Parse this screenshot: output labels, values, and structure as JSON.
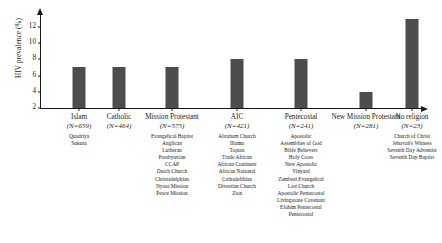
{
  "chart_data": {
    "type": "bar",
    "title": "",
    "xlabel": "",
    "ylabel": "HIV prevalence (%)",
    "ylim": [
      2,
      13.6
    ],
    "yticks": [
      2,
      4,
      6,
      8,
      10,
      12
    ],
    "grid": false,
    "legend": null,
    "categories": [
      "Islam",
      "Catholic",
      "Mission Protestant",
      "AIC",
      "Pentecostal",
      "New Mission Protestant",
      "No religion"
    ],
    "values": [
      7,
      7,
      7,
      8,
      8,
      4,
      13
    ],
    "sample_sizes": [
      "(N=659)",
      "(N=464)",
      "(N=575)",
      "(N=421)",
      "(N=241)",
      "(N=281)",
      "(N=23)"
    ],
    "bar_color": "#4d4d4d"
  },
  "groups": [
    {
      "label": "Islam",
      "n": "(N=659)",
      "value": 7,
      "denominations": [
        "Quadriya",
        "Sukutu"
      ]
    },
    {
      "label": "Catholic",
      "n": "(N=464)",
      "value": 7,
      "denominations": []
    },
    {
      "label": "Mission Protestant",
      "n": "(N=575)",
      "value": 7,
      "denominations": [
        "Evangelical Baptist",
        "Anglican",
        "Lutheran",
        "Presbyterian",
        "CCAP",
        "Dutch Church",
        "Christadelphian",
        "Nyasa Mission",
        "Peace Mission"
      ]
    },
    {
      "label": "AIC",
      "n": "(N=421)",
      "value": 8,
      "denominations": [
        "Abraham Church",
        "Illamu",
        "Topian",
        "Trade African",
        "African Continent",
        "African National",
        "Cathadelthian",
        "Divestian Church",
        "Zion"
      ]
    },
    {
      "label": "Pentecostal",
      "n": "(N=241)",
      "value": 8,
      "denominations": [
        "Apostolic",
        "Assemblies of God",
        "Bible Believers",
        "Holy Cross",
        "New Apostolic",
        "Vinyard",
        "Zambezi Evangelical",
        "Last Church",
        "Apostolic Pentecostal",
        "Livingstone Covenant",
        "Elohim Pentecostal",
        "Pentecostal"
      ]
    },
    {
      "label": "New Mission Protestant",
      "n": "(N=281)",
      "value": 4,
      "denominations": []
    },
    {
      "label": "No religion",
      "n": "(N=23)",
      "value": 13,
      "denominations": [
        "Church of Christ",
        "Jehovah's Witness",
        "Seventh Day Adventist",
        "Seventh Day Baptist"
      ]
    }
  ],
  "denom_columns": [
    {
      "anchor": "Islam",
      "items": [
        "Quadriya",
        "Sukutu"
      ]
    },
    {
      "anchor": "Mission Protestant",
      "items": [
        "Evangelical Baptist",
        "Anglican",
        "Lutheran",
        "Presbyterian",
        "CCAP",
        "Dutch Church",
        "Christadelphian",
        "Nyasa Mission",
        "Peace Mission"
      ]
    },
    {
      "anchor": "AIC",
      "items": [
        "Abraham Church",
        "Illamu",
        "Topian",
        "Trade African",
        "African Continent",
        "African National",
        "Cathadelthian",
        "Divestian Church",
        "Zion"
      ]
    },
    {
      "anchor": "Pentecostal",
      "items": [
        "Apostolic",
        "Assemblies of God",
        "Bible Believers",
        "Holy Cross",
        "New Apostolic",
        "Vinyard",
        "Zambezi Evangelical",
        "Last Church",
        "Apostolic Pentecostal",
        "Livingstone Covenant",
        "Elohim Pentecostal",
        "Pentecostal"
      ]
    },
    {
      "anchor": "No religion",
      "items": [
        "Church of Christ",
        "Jehovah's Witness",
        "Seventh Day Adventist",
        "Seventh Day Baptist"
      ]
    }
  ]
}
